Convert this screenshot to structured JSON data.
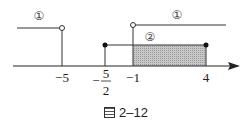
{
  "diagram": {
    "type": "number-line-intervals",
    "axis": {
      "ticks": [
        {
          "value": "-5",
          "label": "−5",
          "px": 62
        },
        {
          "value": "-5/2",
          "label_num": "5",
          "label_den": "2",
          "label_sign": "−",
          "px": 105
        },
        {
          "value": "-1",
          "label": "−1",
          "px": 133
        },
        {
          "value": "4",
          "label": "4",
          "px": 206
        }
      ]
    },
    "labels": {
      "set1_left": "①",
      "set1_right": "①",
      "set2": "②"
    },
    "sets": [
      {
        "name": "①",
        "description": "x < -5 or x > -1",
        "endpoints": "open"
      },
      {
        "name": "②",
        "description": "-5/2 ≤ x ≤ 4",
        "endpoints": "closed"
      }
    ],
    "intersection": {
      "description": "-1 < x ≤ 4",
      "shaded": true
    },
    "colors": {
      "line": "#222222",
      "shade": "#b8b8b8"
    }
  },
  "caption": {
    "icon": "figure-icon",
    "text": "2–12"
  }
}
